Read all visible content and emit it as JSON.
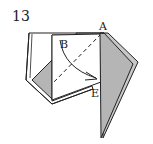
{
  "diagram": {
    "step_number": "13",
    "labels": {
      "a": "A",
      "b": "B",
      "e": "E"
    },
    "colors": {
      "line": "#222222",
      "fill_grey": "#b5b5b5",
      "paper": "#ffffff"
    }
  }
}
